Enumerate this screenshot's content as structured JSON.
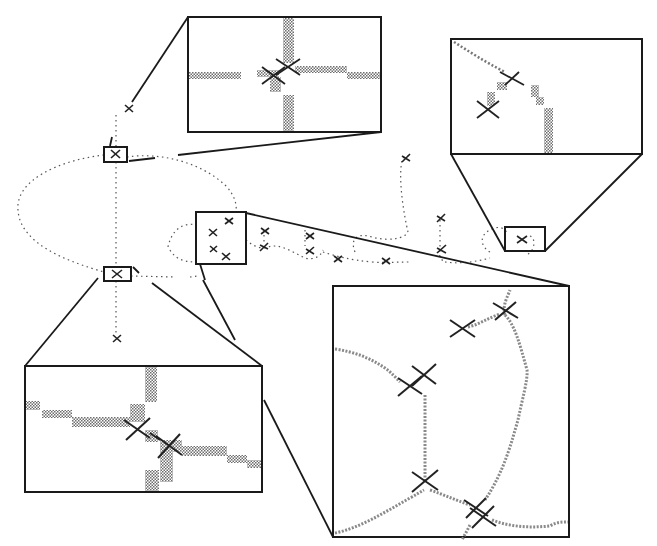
{
  "figure": {
    "colors": {
      "background": "#ffffff",
      "line": "#1a1a1a",
      "dotted_curve": "#555555",
      "pixel_trace": "#8a8a8a",
      "cross": "#222222"
    },
    "small_boxes": [
      {
        "id": "A",
        "x": 104,
        "y": 147,
        "w": 23,
        "h": 15
      },
      {
        "id": "B",
        "x": 104,
        "y": 267,
        "w": 27,
        "h": 14
      },
      {
        "id": "C",
        "x": 196,
        "y": 212,
        "w": 50,
        "h": 52
      },
      {
        "id": "D",
        "x": 505,
        "y": 227,
        "w": 40,
        "h": 24
      }
    ],
    "insets": [
      {
        "id": "inset-top",
        "source": "A",
        "x": 188,
        "y": 17,
        "w": 193,
        "h": 115
      },
      {
        "id": "inset-top-right",
        "source": "D",
        "x": 451,
        "y": 39,
        "w": 191,
        "h": 115
      },
      {
        "id": "inset-bottom-left",
        "source": "B",
        "x": 25,
        "y": 366,
        "w": 237,
        "h": 126
      },
      {
        "id": "inset-bottom-right",
        "source": "C",
        "x": 333,
        "y": 286,
        "w": 236,
        "h": 251
      }
    ],
    "markers_count": 16
  }
}
